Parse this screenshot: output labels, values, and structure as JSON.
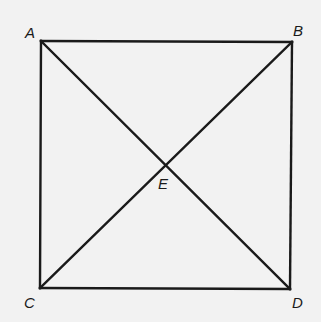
{
  "figure": {
    "type": "square-with-diagonals",
    "stroke_color": "#1a1a1a",
    "background": "#f2f2f2",
    "points": {
      "A": {
        "label": "A",
        "x": 41,
        "y": 41
      },
      "B": {
        "label": "B",
        "x": 292,
        "y": 42
      },
      "C": {
        "label": "C",
        "x": 40,
        "y": 288
      },
      "D": {
        "label": "D",
        "x": 290,
        "y": 289
      },
      "E": {
        "label": "E",
        "x": 166,
        "y": 165
      }
    },
    "segments": [
      "AB",
      "BD",
      "DC",
      "CA",
      "AD",
      "BC"
    ]
  }
}
